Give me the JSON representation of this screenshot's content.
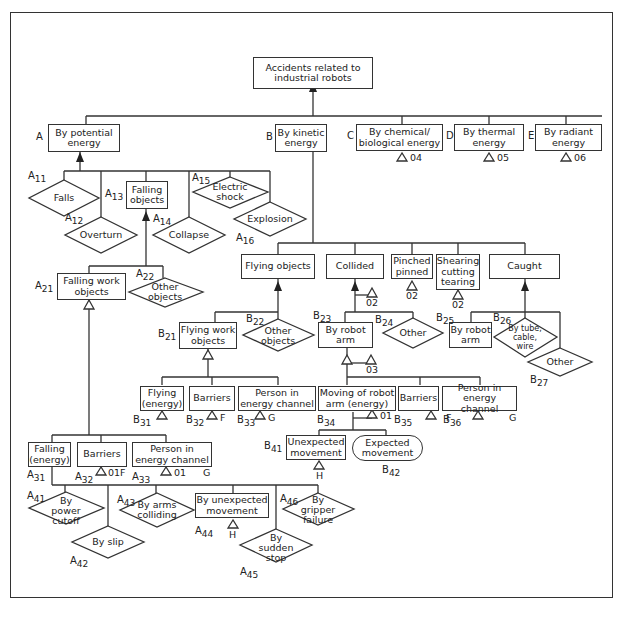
{
  "title": "Accidents related to industrial robots",
  "level1": [
    {
      "id": "A",
      "label": "By potential energy"
    },
    {
      "id": "B",
      "label": "By kinetic energy"
    },
    {
      "id": "C",
      "label": "By chemical/ biological energy",
      "transfer": "04"
    },
    {
      "id": "D",
      "label": "By thermal energy",
      "transfer": "05"
    },
    {
      "id": "E",
      "label": "By radiant energy",
      "transfer": "06"
    }
  ],
  "potential": {
    "A11": "Falls",
    "A12": "Overturn",
    "A13": "Falling objects",
    "A14": "Collapse",
    "A15": "Electric shock",
    "A16": "Explosion",
    "A21": "Falling work objects",
    "A22": "Other objects",
    "A31": "Falling (energy)",
    "A32": "Barriers",
    "A32_transfer": "01F",
    "A33": "Person in energy channel",
    "A33_transfer": "01",
    "A33_g": "G",
    "A41": "By power cutoff",
    "A42": "By slip",
    "A43": "By arms colliding",
    "A44": "By unexpected movement",
    "A44_transfer": "H",
    "A45": "By sudden stop",
    "A46": "By gripper failure"
  },
  "kinetic": {
    "flying": "Flying objects",
    "collided": "Collided",
    "collided_transfer": "02",
    "pinched": "Pinched pinned",
    "pinched_transfer": "02",
    "shearing": "Shearing cutting tearing",
    "shearing_transfer": "02",
    "caught": "Caught",
    "B21": "Flying work objects",
    "B22": "Other objects",
    "B23": "By robot arm",
    "B23_transfer": "03",
    "B24": "Other",
    "B25": "By robot arm",
    "B26": "By tube, cable, wire",
    "B27": "Other",
    "B31": "Flying (energy)",
    "B32": "Barriers",
    "B32_f": "F",
    "B33": "Person in energy channel",
    "B33_g": "G",
    "B34": "Moving of robot arm (energy)",
    "B34_transfer": "01",
    "B35": "Barriers",
    "B35_f": "F",
    "B36": "Person in energy channel",
    "B36_g": "G",
    "B41": "Unexpected movement",
    "B41_transfer": "H",
    "B42": "Expected movement"
  },
  "labels": {
    "A": "A",
    "B": "B",
    "C": "C",
    "D": "D",
    "E": "E",
    "A11": [
      "A",
      "11"
    ],
    "A12": [
      "A",
      "12"
    ],
    "A13": [
      "A",
      "13"
    ],
    "A14": [
      "A",
      "14"
    ],
    "A15": [
      "A",
      "15"
    ],
    "A16": [
      "A",
      "16"
    ],
    "A21": [
      "A",
      "21"
    ],
    "A22": [
      "A",
      "22"
    ],
    "A31": [
      "A",
      "31"
    ],
    "A32": [
      "A",
      "32"
    ],
    "A33": [
      "A",
      "33"
    ],
    "A41": [
      "A",
      "41"
    ],
    "A42": [
      "A",
      "42"
    ],
    "A43": [
      "A",
      "43"
    ],
    "A44": [
      "A",
      "44"
    ],
    "A45": [
      "A",
      "45"
    ],
    "A46": [
      "A",
      "46"
    ],
    "B21": [
      "B",
      "21"
    ],
    "B22": [
      "B",
      "22"
    ],
    "B23": [
      "B",
      "23"
    ],
    "B24": [
      "B",
      "24"
    ],
    "B25": [
      "B",
      "25"
    ],
    "B26": [
      "B",
      "26"
    ],
    "B27": [
      "B",
      "27"
    ],
    "B31": [
      "B",
      "31"
    ],
    "B32": [
      "B",
      "32"
    ],
    "B33": [
      "B",
      "33"
    ],
    "B34": [
      "B",
      "34"
    ],
    "B35": [
      "B",
      "35"
    ],
    "B36": [
      "B",
      "36"
    ],
    "B41": [
      "B",
      "41"
    ],
    "B42": [
      "B",
      "42"
    ]
  }
}
